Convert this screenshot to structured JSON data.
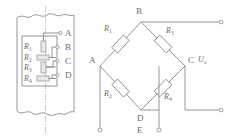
{
  "figure": {
    "colors": {
      "line": "#8a8a8a",
      "label": "#6b6b6b",
      "centerline": "#b5b5b5",
      "gauge_fill": "#e8e8e8",
      "background": "#ffffff"
    }
  },
  "specimen": {
    "name": "strain-gauge-specimen",
    "description": "Beam section with four bonded strain gauges and break lines at top and bottom",
    "terminals": [
      {
        "id": "A",
        "label": "A"
      },
      {
        "id": "B",
        "label": "B"
      },
      {
        "id": "C",
        "label": "C"
      },
      {
        "id": "D",
        "label": "D"
      }
    ],
    "gauges": [
      {
        "id": "R1",
        "label": "R",
        "sub": "1",
        "orientation": "vertical"
      },
      {
        "id": "R2",
        "label": "R",
        "sub": "2",
        "orientation": "horizontal"
      },
      {
        "id": "R3",
        "label": "R",
        "sub": "3",
        "orientation": "vertical"
      },
      {
        "id": "R4",
        "label": "R",
        "sub": "4",
        "orientation": "horizontal"
      }
    ]
  },
  "bridge": {
    "name": "wheatstone-bridge",
    "nodes": [
      {
        "id": "B",
        "label": "B",
        "position": "top"
      },
      {
        "id": "A",
        "label": "A",
        "position": "left"
      },
      {
        "id": "C",
        "label": "C",
        "position": "right"
      },
      {
        "id": "D",
        "label": "D",
        "position": "bottom"
      },
      {
        "id": "E",
        "label": "E",
        "position": "below-bottom"
      }
    ],
    "arms": [
      {
        "id": "R1",
        "label": "R",
        "sub": "1",
        "between": [
          "A",
          "B"
        ]
      },
      {
        "id": "R3",
        "label": "R",
        "sub": "3",
        "between": [
          "B",
          "C"
        ]
      },
      {
        "id": "R2",
        "label": "R",
        "sub": "2",
        "between": [
          "A",
          "D"
        ]
      },
      {
        "id": "R4",
        "label": "R",
        "sub": "4",
        "between": [
          "D",
          "C"
        ]
      }
    ],
    "output": {
      "label": "U",
      "sub": "o",
      "name": "output-voltage"
    },
    "terminals": [
      {
        "id": "T_B",
        "from": "B",
        "side": "right-top"
      },
      {
        "id": "T_C",
        "from": "C",
        "side": "right-bottom"
      },
      {
        "id": "T_A",
        "from": "A",
        "side": "bottom-left"
      },
      {
        "id": "T_E",
        "from": "E",
        "side": "bottom-center"
      }
    ]
  }
}
